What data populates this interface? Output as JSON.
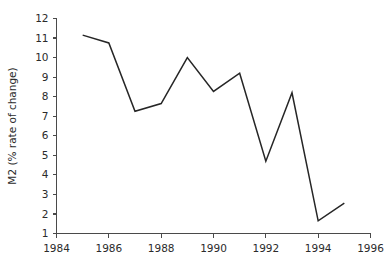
{
  "chart_data": {
    "type": "line",
    "title": "",
    "subtitle": "",
    "xlabel": "",
    "ylabel": "M2 (% rate of change)",
    "xlim": [
      1984,
      1996
    ],
    "ylim": [
      1,
      12
    ],
    "grid": false,
    "legend": null,
    "legend_position": "none",
    "x_ticks": [
      1984,
      1986,
      1988,
      1990,
      1992,
      1994,
      1996
    ],
    "x_tick_labels": [
      "1984",
      "1986",
      "1988",
      "1990",
      "1992",
      "1994",
      "1996"
    ],
    "y_ticks": [
      1,
      2,
      3,
      4,
      5,
      6,
      7,
      8,
      9,
      10,
      11,
      12
    ],
    "y_tick_labels": [
      "1",
      "2",
      "3",
      "4",
      "5",
      "6",
      "7",
      "8",
      "9",
      "10",
      "11",
      "12"
    ],
    "x": [
      1985,
      1986,
      1987,
      1988,
      1989,
      1990,
      1991,
      1992,
      1993,
      1994,
      1995
    ],
    "values": [
      11.15,
      10.75,
      7.25,
      7.65,
      10.0,
      8.27,
      9.2,
      4.7,
      8.2,
      1.65,
      2.55
    ],
    "series": [
      {
        "name": "M2",
        "color": "#262626",
        "x": [
          1985,
          1986,
          1987,
          1988,
          1989,
          1990,
          1991,
          1992,
          1993,
          1994,
          1995
        ],
        "values": [
          11.15,
          10.75,
          7.25,
          7.65,
          10.0,
          8.27,
          9.2,
          4.7,
          8.2,
          1.65,
          2.55
        ]
      }
    ],
    "annotations": []
  },
  "colors": {
    "background": "#ffffff",
    "axis": "#4a4a4a",
    "text": "#2b2b2b",
    "line": "#262626"
  }
}
